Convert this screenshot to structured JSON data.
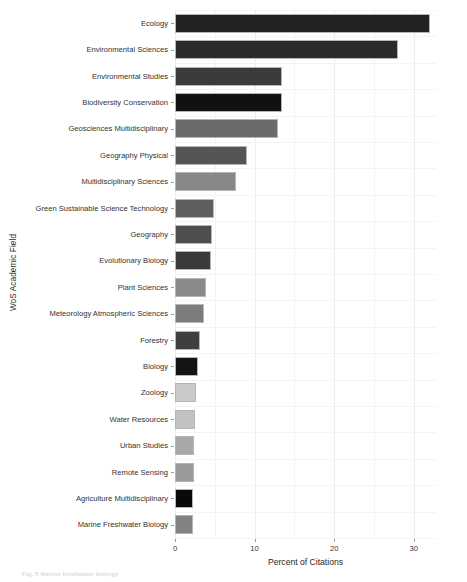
{
  "figure": {
    "ylabel": "WoS Academic Field",
    "xlabel": "Percent of Citations",
    "caption": "Fig. 5  Marine freshwater biology"
  },
  "chart_data": {
    "type": "bar",
    "orientation": "horizontal",
    "title": "",
    "xlabel": "Percent of Citations",
    "ylabel": "WoS Academic Field",
    "xlim": [
      0,
      32.8
    ],
    "xticks": [
      0,
      10,
      20,
      30
    ],
    "xtick_labels": [
      "0",
      "10",
      "20",
      "30"
    ],
    "minor_xticks": [
      5,
      15,
      25
    ],
    "grid": true,
    "legend": "none",
    "categories": [
      "Ecology",
      "Environmental Sciences",
      "Environmental Studies",
      "Biodiversity Conservation",
      "Geosciences Multidisciplinary",
      "Geography Physical",
      "Multidisciplinary Sciences",
      "Green Sustainable Science Technology",
      "Geography",
      "Evolutionary Biology",
      "Plant Sciences",
      "Meteorology Atmospheric Sciences",
      "Forestry",
      "Biology",
      "Zoology",
      "Water Resources",
      "Urban Studies",
      "Remote Sensing",
      "Agriculture Multidisciplinary",
      "Marine Freshwater Biology"
    ],
    "values": [
      32.0,
      28.0,
      13.5,
      13.5,
      13.0,
      9.0,
      7.7,
      4.9,
      4.6,
      4.5,
      3.9,
      3.7,
      3.2,
      2.9,
      2.6,
      2.5,
      2.4,
      2.4,
      2.3,
      2.3
    ],
    "bar_colors": [
      "#222222",
      "#2b2b2b",
      "#3b3b3b",
      "#111111",
      "#6b6b6b",
      "#555555",
      "#888888",
      "#5e5e5e",
      "#4e4e4e",
      "#3a3a3a",
      "#8a8a8a",
      "#7c7c7c",
      "#3f3f3f",
      "#141414",
      "#cacaca",
      "#c2c2c2",
      "#a8a8a8",
      "#9a9a9a",
      "#090909",
      "#828282"
    ]
  }
}
